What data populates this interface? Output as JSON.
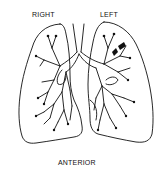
{
  "diagram": {
    "labels": {
      "right": "RIGHT",
      "left": "LEFT",
      "view": "ANTERIOR"
    },
    "colors": {
      "line": "#111111",
      "background": "#ffffff"
    }
  }
}
